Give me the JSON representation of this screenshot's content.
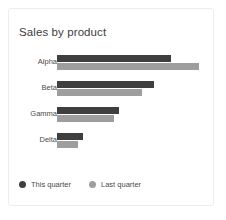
{
  "card": {
    "background": "#ffffff",
    "border_color": "#ededed"
  },
  "chart_data": {
    "type": "bar",
    "orientation": "horizontal",
    "grouped": true,
    "title": "Sales by product",
    "subtitle": "",
    "xlabel": "",
    "ylabel": "",
    "categories": [
      "Alpha",
      "Beta",
      "Gamma",
      "Delta"
    ],
    "series": [
      {
        "name": "This quarter",
        "color": "#3f3f3f",
        "values": [
          80,
          68,
          44,
          18
        ]
      },
      {
        "name": "Last quarter",
        "color": "#9e9e9e",
        "values": [
          100,
          60,
          40,
          15
        ]
      }
    ],
    "xlim": [
      0,
      100
    ],
    "grid": false,
    "axis_ticks_visible": false,
    "legend_position": "bottom-left",
    "legend": [
      "This quarter",
      "Last quarter"
    ]
  },
  "legend": {
    "items": [
      {
        "label": "This quarter",
        "color": "#3f3f3f",
        "icon": "circle-dot-icon"
      },
      {
        "label": "Last quarter",
        "color": "#9e9e9e",
        "icon": "circle-dot-icon"
      }
    ]
  }
}
